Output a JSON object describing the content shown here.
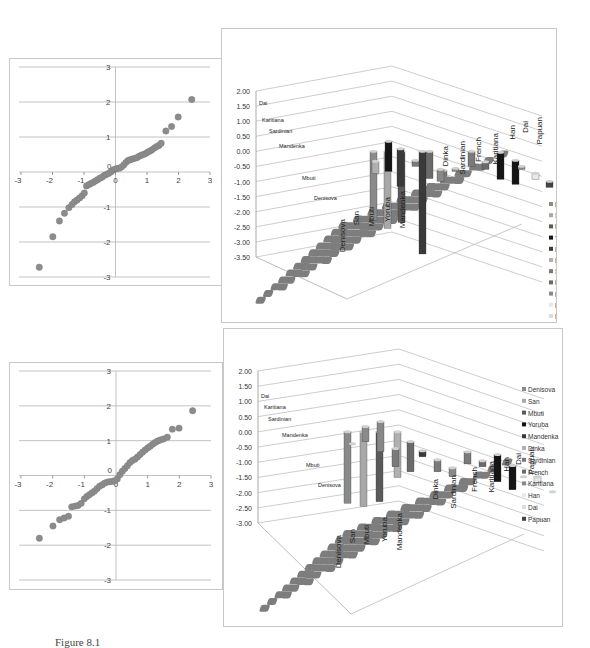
{
  "caption": "Figure 8.1",
  "chart_data": [
    {
      "id": "scatter-top",
      "type": "scatter",
      "title": "",
      "xlabel": "",
      "ylabel": "",
      "xlim": [
        -3,
        3
      ],
      "ylim": [
        -3,
        3
      ],
      "x_ticks": [
        "-3",
        "-2",
        "-1",
        "0",
        "1",
        "2",
        "3"
      ],
      "y_ticks": [
        "3",
        "2",
        "1",
        "0",
        "-1",
        "-2",
        "-3"
      ],
      "grid": "horizontal",
      "color": "#8c8c8c",
      "points": [
        [
          -2.42,
          -2.72
        ],
        [
          -1.99,
          -1.85
        ],
        [
          -1.78,
          -1.4
        ],
        [
          -1.62,
          -1.18
        ],
        [
          -1.48,
          -1.02
        ],
        [
          -1.38,
          -0.93
        ],
        [
          -1.3,
          -0.85
        ],
        [
          -1.22,
          -0.8
        ],
        [
          -1.14,
          -0.74
        ],
        [
          -1.06,
          -0.68
        ],
        [
          -0.99,
          -0.6
        ],
        [
          -0.92,
          -0.4
        ],
        [
          -0.85,
          -0.36
        ],
        [
          -0.78,
          -0.33
        ],
        [
          -0.71,
          -0.3
        ],
        [
          -0.64,
          -0.26
        ],
        [
          -0.57,
          -0.22
        ],
        [
          -0.5,
          -0.18
        ],
        [
          -0.43,
          -0.15
        ],
        [
          -0.36,
          -0.1
        ],
        [
          -0.29,
          -0.07
        ],
        [
          -0.22,
          -0.04
        ],
        [
          -0.15,
          0.0
        ],
        [
          -0.08,
          0.05
        ],
        [
          -0.02,
          0.08
        ],
        [
          0.05,
          0.1
        ],
        [
          0.12,
          0.11
        ],
        [
          0.19,
          0.14
        ],
        [
          0.26,
          0.2
        ],
        [
          0.33,
          0.27
        ],
        [
          0.4,
          0.33
        ],
        [
          0.47,
          0.35
        ],
        [
          0.54,
          0.37
        ],
        [
          0.61,
          0.39
        ],
        [
          0.68,
          0.41
        ],
        [
          0.75,
          0.45
        ],
        [
          0.82,
          0.48
        ],
        [
          0.89,
          0.5
        ],
        [
          0.96,
          0.53
        ],
        [
          1.03,
          0.57
        ],
        [
          1.1,
          0.6
        ],
        [
          1.17,
          0.64
        ],
        [
          1.24,
          0.69
        ],
        [
          1.31,
          0.73
        ],
        [
          1.38,
          0.76
        ],
        [
          1.45,
          0.82
        ],
        [
          1.6,
          1.17
        ],
        [
          1.78,
          1.3
        ],
        [
          1.99,
          1.57
        ],
        [
          2.42,
          2.07
        ]
      ]
    },
    {
      "id": "bar3d-top",
      "type": "bar3d",
      "title": "",
      "z_ticks": [
        "2.00",
        "1.50",
        "1.00",
        "0.50",
        "0.00",
        "-0.50",
        "-1.00",
        "-1.50",
        "-2.00",
        "-2.50",
        "-3.00",
        "-3.50"
      ],
      "zlim": [
        -3.5,
        2.0
      ],
      "x_categories": [
        "Denisova",
        "San",
        "Mbuti",
        "Yoruba",
        "Mandenka",
        "Dinka",
        "Sardinian",
        "French",
        "Karitiana",
        "Han",
        "Dai",
        "Papuan"
      ],
      "depth_labels": [
        "Dai",
        "Karitiana",
        "Sardinian",
        "Mandenka",
        "Mbuti",
        "Denisova"
      ],
      "legend": [
        "Denisova",
        "San",
        "Mbuti",
        "Yoruba",
        "Mandenka",
        "Dinka",
        "Sardinian",
        "French",
        "Karitiana",
        "Han",
        "Dai",
        "Papuan"
      ],
      "legend_colors": [
        "#8a8a8a",
        "#a8a8a8",
        "#5a5a5a",
        "#151515",
        "#3a3a3a",
        "#b0b0b0",
        "#7a7a7a",
        "#6a6a6a",
        "#888888",
        "#e8e8e8",
        "#dcdcdc",
        "#444444"
      ],
      "notable_values": {
        "Mandenka_min": -3.4,
        "max": 1.25
      }
    },
    {
      "id": "scatter-bottom",
      "type": "scatter",
      "title": "",
      "xlabel": "",
      "ylabel": "",
      "xlim": [
        -3,
        3
      ],
      "ylim": [
        -3,
        3
      ],
      "x_ticks": [
        "-3",
        "-2",
        "-1",
        "0",
        "1",
        "2",
        "3"
      ],
      "y_ticks": [
        "3",
        "2",
        "1",
        "0",
        "-1",
        "-2",
        "-3"
      ],
      "grid": "horizontal",
      "color": "#8c8c8c",
      "points": [
        [
          -2.42,
          -1.8
        ],
        [
          -1.99,
          -1.45
        ],
        [
          -1.78,
          -1.27
        ],
        [
          -1.64,
          -1.22
        ],
        [
          -1.5,
          -1.17
        ],
        [
          -1.4,
          -0.9
        ],
        [
          -1.3,
          -0.88
        ],
        [
          -1.2,
          -0.86
        ],
        [
          -1.1,
          -0.8
        ],
        [
          -1.0,
          -0.67
        ],
        [
          -0.92,
          -0.6
        ],
        [
          -0.84,
          -0.55
        ],
        [
          -0.76,
          -0.5
        ],
        [
          -0.68,
          -0.45
        ],
        [
          -0.6,
          -0.38
        ],
        [
          -0.52,
          -0.31
        ],
        [
          -0.44,
          -0.27
        ],
        [
          -0.36,
          -0.22
        ],
        [
          -0.28,
          -0.19
        ],
        [
          -0.2,
          -0.18
        ],
        [
          -0.12,
          -0.17
        ],
        [
          -0.04,
          -0.15
        ],
        [
          0.04,
          -0.1
        ],
        [
          0.12,
          0.02
        ],
        [
          0.2,
          0.12
        ],
        [
          0.28,
          0.2
        ],
        [
          0.36,
          0.28
        ],
        [
          0.44,
          0.37
        ],
        [
          0.52,
          0.43
        ],
        [
          0.6,
          0.47
        ],
        [
          0.68,
          0.53
        ],
        [
          0.76,
          0.6
        ],
        [
          0.84,
          0.67
        ],
        [
          0.92,
          0.73
        ],
        [
          1.0,
          0.79
        ],
        [
          1.08,
          0.84
        ],
        [
          1.16,
          0.9
        ],
        [
          1.24,
          0.95
        ],
        [
          1.32,
          0.99
        ],
        [
          1.4,
          1.02
        ],
        [
          1.5,
          1.05
        ],
        [
          1.62,
          1.1
        ],
        [
          1.78,
          1.33
        ],
        [
          1.99,
          1.36
        ],
        [
          2.42,
          1.86
        ]
      ]
    },
    {
      "id": "bar3d-bottom",
      "type": "bar3d",
      "title": "",
      "z_ticks": [
        "2.00",
        "1.50",
        "1.00",
        "0.50",
        "0.00",
        "-0.50",
        "-1.00",
        "-1.50",
        "-2.00",
        "-2.50",
        "-3.00"
      ],
      "zlim": [
        -3.0,
        2.0
      ],
      "x_categories": [
        "Denisova",
        "San",
        "Mbuti",
        "Yoruba",
        "Mandenka",
        "Dinka",
        "Sardinian",
        "French",
        "Karitiana",
        "Han",
        "Dai",
        "Papuan"
      ],
      "depth_labels": [
        "Dai",
        "Karitiana",
        "Sardinian",
        "Mandenka",
        "Mbuti",
        "Denisova"
      ],
      "legend": [
        "Denisova",
        "San",
        "Mbuti",
        "Yoruba",
        "Mandenka",
        "Dinka",
        "Sardinian",
        "French",
        "Karitiana",
        "Han",
        "Dai",
        "Papuan"
      ],
      "legend_colors": [
        "#8a8a8a",
        "#a8a8a8",
        "#5a5a5a",
        "#151515",
        "#3a3a3a",
        "#b0b0b0",
        "#7a7a7a",
        "#6a6a6a",
        "#888888",
        "#e8e8e8",
        "#dcdcdc",
        "#444444"
      ]
    }
  ]
}
